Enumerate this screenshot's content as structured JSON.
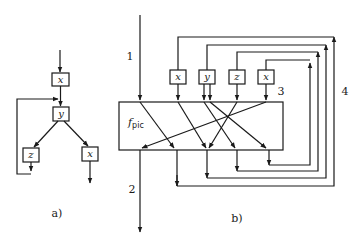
{
  "part_a": {
    "caption": "a)",
    "nodes": [
      {
        "id": "a_x1",
        "label": "x"
      },
      {
        "id": "a_y",
        "label": "y"
      },
      {
        "id": "a_z",
        "label": "z"
      },
      {
        "id": "a_x2",
        "label": "x"
      }
    ]
  },
  "part_b": {
    "caption": "b)",
    "block_label": "f",
    "block_subscript": "pic",
    "nodes": [
      {
        "id": "b_x1",
        "label": "x"
      },
      {
        "id": "b_y",
        "label": "y"
      },
      {
        "id": "b_z",
        "label": "z"
      },
      {
        "id": "b_x2",
        "label": "x"
      }
    ],
    "edge_labels": {
      "input": "1",
      "output": "2",
      "box_arrow": "3",
      "feedback": "4"
    }
  },
  "colors": {
    "stroke": "#1a1a1a",
    "background": "#ffffff"
  }
}
